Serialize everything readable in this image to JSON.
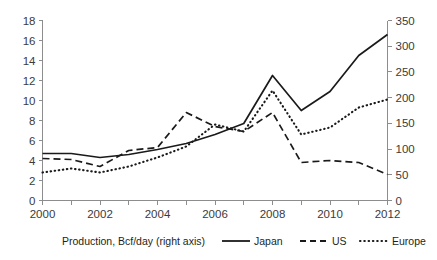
{
  "chart_data": {
    "type": "line",
    "title": "",
    "subtitle": "",
    "xlabel": "",
    "ylabel": "",
    "y2label": "",
    "grid": false,
    "legend_position": "bottom",
    "x": [
      2000,
      2001,
      2002,
      2003,
      2004,
      2005,
      2006,
      2007,
      2008,
      2009,
      2010,
      2011,
      2012
    ],
    "xlim": [
      2000,
      2012
    ],
    "xtick_labels": [
      "2000",
      "2002",
      "2004",
      "2006",
      "2008",
      "2010",
      "2012"
    ],
    "xticks_major": [
      2000,
      2002,
      2004,
      2006,
      2008,
      2010,
      2012
    ],
    "xticks_minor": [
      2001,
      2003,
      2005,
      2007,
      2009,
      2011
    ],
    "ylim": [
      0,
      18
    ],
    "ytick_labels": [
      "0",
      "2",
      "4",
      "6",
      "8",
      "10",
      "12",
      "14",
      "16",
      "18"
    ],
    "yticks": [
      0,
      2,
      4,
      6,
      8,
      10,
      12,
      14,
      16,
      18
    ],
    "y2lim": [
      0,
      350
    ],
    "y2tick_labels": [
      "0",
      "50",
      "100",
      "150",
      "200",
      "250",
      "300",
      "350"
    ],
    "y2ticks": [
      0,
      50,
      100,
      150,
      200,
      250,
      300,
      350
    ],
    "series": [
      {
        "name": "Japan",
        "style": "solid",
        "values": [
          4.7,
          4.7,
          4.3,
          4.6,
          5.1,
          5.7,
          6.6,
          7.7,
          12.5,
          9.0,
          10.9,
          14.5,
          16.6
        ]
      },
      {
        "name": "US",
        "style": "dashed",
        "values": [
          4.2,
          4.1,
          3.4,
          5.0,
          5.3,
          8.8,
          7.4,
          6.9,
          8.8,
          3.8,
          4.0,
          3.8,
          2.6
        ]
      },
      {
        "name": "Europe",
        "style": "dotted",
        "values": [
          2.8,
          3.2,
          2.8,
          3.4,
          4.3,
          5.4,
          7.6,
          6.9,
          11.0,
          6.6,
          7.3,
          9.3,
          10.1
        ]
      }
    ]
  },
  "legend": {
    "caption": "Production, Bcf/day (right axis)",
    "entries": [
      {
        "label": "Japan",
        "style": "solid"
      },
      {
        "label": "US",
        "style": "dashed"
      },
      {
        "label": "Europe",
        "style": "dotted"
      }
    ]
  },
  "colors": {
    "line": "#1a1a1a",
    "axis": "#8d8d8d",
    "text": "#231f20",
    "background": "#ffffff"
  }
}
